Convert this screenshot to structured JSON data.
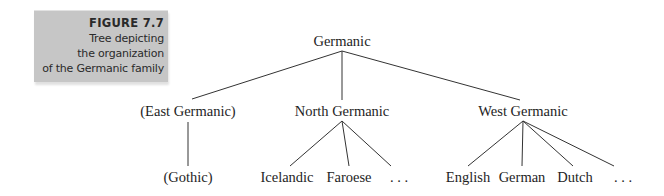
{
  "figure": {
    "label": "FIGURE 7.7",
    "caption_lines": [
      "Tree depicting",
      "the organization",
      "of the Germanic family"
    ],
    "box_color": "#c6c6c6"
  },
  "tree": {
    "root": {
      "label": "Germanic"
    },
    "branches": [
      {
        "label": "(East Germanic)",
        "children": [
          "(Gothic)"
        ]
      },
      {
        "label": "North Germanic",
        "children": [
          "Icelandic",
          "Faroese",
          ". . ."
        ]
      },
      {
        "label": "West Germanic",
        "children": [
          "English",
          "German",
          "Dutch",
          ". . ."
        ]
      }
    ]
  }
}
